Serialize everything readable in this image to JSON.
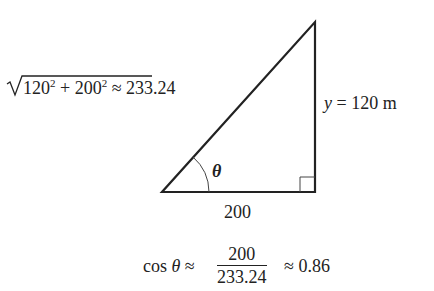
{
  "diagram": {
    "type": "right-triangle",
    "vertices": {
      "bottom_left": [
        162,
        192
      ],
      "bottom_right": [
        315,
        192
      ],
      "top_right": [
        315,
        22
      ]
    },
    "right_angle_marker": "bottom-right",
    "angle_label": "θ",
    "hypotenuse": {
      "radicand_a": "120",
      "radicand_b": "200",
      "exponent": "2",
      "plus": "+",
      "approx": "≈",
      "value": "233.24"
    },
    "vertical_side": {
      "var": "y",
      "equals": "=",
      "value": "120 m"
    },
    "base": {
      "value": "200"
    },
    "formula": {
      "func": "cos",
      "var": "θ",
      "approx1": "≈",
      "numerator": "200",
      "denominator": "233.24",
      "approx2": "≈",
      "result": "0.86"
    },
    "colors": {
      "line": "#222222",
      "background": "#ffffff"
    }
  }
}
